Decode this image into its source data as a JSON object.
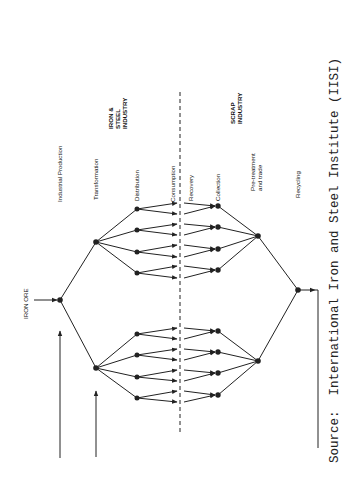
{
  "diagram": {
    "orientation": "rotated-90-ccw",
    "stage_labels": [
      {
        "id": "industrial-production",
        "text": "Industrial Production",
        "x": 60,
        "y": 200
      },
      {
        "id": "transformation",
        "text": "Transformation",
        "x": 96,
        "y": 198
      },
      {
        "id": "distribution",
        "text": "Distribution",
        "x": 137,
        "y": 200
      },
      {
        "id": "consumption",
        "text": "Consumption",
        "x": 173,
        "y": 200
      },
      {
        "id": "recovery",
        "text": "Recovery",
        "x": 191,
        "y": 200
      },
      {
        "id": "collection",
        "text": "Collection",
        "x": 218,
        "y": 200
      },
      {
        "id": "pretreatment-1",
        "text": "Pre-treatment",
        "x": 253,
        "y": 200
      },
      {
        "id": "pretreatment-2",
        "text": "and trade",
        "x": 260,
        "y": 200
      },
      {
        "id": "recycling",
        "text": "Recycling",
        "x": 298,
        "y": 200
      }
    ],
    "group_labels": {
      "iron_steel": [
        "IRON &",
        "STEEL",
        "INDUSTRY"
      ],
      "scrap": [
        "SCRAP",
        "INDUSTRY"
      ]
    },
    "input_label": "IRON ORE",
    "source": "Source:  International Iron and Steel Institute (IISI)",
    "colors": {
      "ink": "#222222",
      "background": "#ffffff"
    }
  }
}
